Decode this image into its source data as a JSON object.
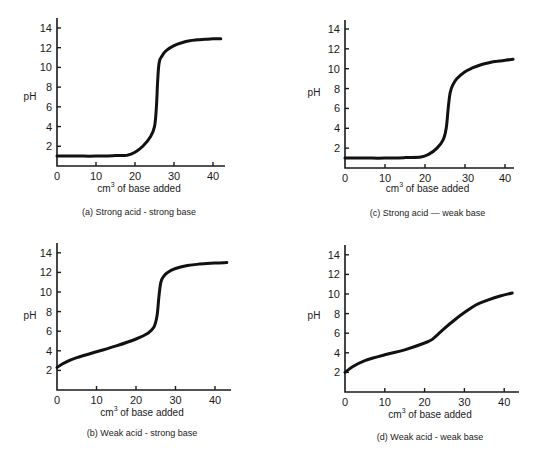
{
  "chart_data": [
    {
      "id": "a",
      "type": "line",
      "title": "(a) Strong acid - strong base",
      "xlabel": "cm3 of base added",
      "xlabel_main": "cm",
      "xlabel_sup": "3",
      "xlabel_rest": " of base added",
      "ylabel": "pH",
      "xlim": [
        0,
        42
      ],
      "ylim": [
        0,
        15
      ],
      "xticks": [
        0,
        10,
        20,
        30,
        40
      ],
      "yticks": [
        2,
        4,
        6,
        8,
        10,
        12,
        14
      ],
      "grid": false,
      "series": [
        {
          "name": "pH",
          "x": [
            0,
            5,
            10,
            15,
            18,
            20,
            22,
            24,
            25,
            25.5,
            25.8,
            26.2,
            27,
            28,
            30,
            32,
            34,
            36,
            38,
            40,
            42
          ],
          "y": [
            1.0,
            1.0,
            1.0,
            1.05,
            1.1,
            1.4,
            2.0,
            3.0,
            4.0,
            6.0,
            8.5,
            10.5,
            11.2,
            11.7,
            12.2,
            12.5,
            12.7,
            12.8,
            12.85,
            12.9,
            12.9
          ]
        }
      ],
      "layout": {
        "ox": 57,
        "oy": 166,
        "sx": 3.9,
        "sy": 9.86,
        "ytop": 18,
        "xend": 225,
        "ylabel_x": 30,
        "ylabel_y": 100,
        "xlabel_y": 192,
        "title_y": 215
      }
    },
    {
      "id": "c",
      "type": "line",
      "title": "(c) Strong acid — weak base",
      "xlabel": "cm3 of base added",
      "xlabel_main": "cm",
      "xlabel_sup": "3",
      "xlabel_rest": " of base added",
      "ylabel": "pH",
      "xlim": [
        0,
        42
      ],
      "ylim": [
        0,
        15
      ],
      "xticks": [
        0,
        10,
        20,
        30,
        40
      ],
      "xtick_labels": [
        "0",
        "10",
        "20",
        ". 30",
        "40"
      ],
      "yticks": [
        2,
        4,
        6,
        8,
        10,
        12,
        14
      ],
      "grid": false,
      "series": [
        {
          "name": "pH",
          "x": [
            0,
            5,
            10,
            15,
            19,
            21,
            23,
            24.5,
            25.3,
            25.8,
            26.3,
            27,
            28,
            30,
            32,
            34,
            36,
            38,
            40,
            42
          ],
          "y": [
            1.0,
            1.0,
            1.0,
            1.05,
            1.1,
            1.4,
            2.0,
            2.8,
            4.0,
            6.0,
            7.6,
            8.4,
            9.0,
            9.7,
            10.1,
            10.4,
            10.6,
            10.75,
            10.85,
            10.95
          ]
        }
      ],
      "layout": {
        "ox": 345,
        "oy": 168,
        "sx": 4.0,
        "sy": 9.93,
        "ytop": 20,
        "xend": 514,
        "ylabel_x": 314,
        "ylabel_y": 96,
        "xlabel_y": 192,
        "title_y": 216
      }
    },
    {
      "id": "b",
      "type": "line",
      "title": "(b) Weak acid - strong base",
      "xlabel": "cm3 of base added",
      "xlabel_main": "cm",
      "xlabel_sup": "3",
      "xlabel_rest": " of base added",
      "ylabel": "pH",
      "xlim": [
        0,
        44
      ],
      "ylim": [
        0,
        15
      ],
      "xticks": [
        0,
        10,
        20,
        30,
        40
      ],
      "yticks": [
        2,
        4,
        6,
        8,
        10,
        12,
        14
      ],
      "grid": false,
      "series": [
        {
          "name": "pH",
          "x": [
            0,
            2,
            5,
            10,
            15,
            20,
            23,
            24.5,
            25.3,
            25.8,
            26.3,
            27,
            28,
            30,
            33,
            36,
            40,
            43
          ],
          "y": [
            2.3,
            2.8,
            3.3,
            3.9,
            4.5,
            5.2,
            5.8,
            6.4,
            7.5,
            9.5,
            11.0,
            11.6,
            12.0,
            12.4,
            12.7,
            12.85,
            12.95,
            13.0
          ]
        }
      ],
      "layout": {
        "ox": 57,
        "oy": 390,
        "sx": 3.95,
        "sy": 9.8,
        "ytop": 243,
        "xend": 231,
        "ylabel_x": 30,
        "ylabel_y": 319,
        "xlabel_y": 416,
        "title_y": 436
      }
    },
    {
      "id": "d",
      "type": "line",
      "title": "(d) Weak acid - weak base",
      "xlabel": "cm3 of base added",
      "xlabel_main": "cm",
      "xlabel_sup": "3",
      "xlabel_rest": " of base added",
      "ylabel": "pH",
      "xlim": [
        0,
        44
      ],
      "ylim": [
        0,
        15
      ],
      "xticks": [
        0,
        10,
        20,
        30,
        40
      ],
      "yticks": [
        2,
        4,
        6,
        8,
        10,
        12,
        14
      ],
      "grid": false,
      "series": [
        {
          "name": "pH",
          "x": [
            0,
            2,
            5,
            10,
            15,
            20,
            22,
            25,
            28,
            30,
            33,
            36,
            39,
            42
          ],
          "y": [
            2.0,
            2.6,
            3.2,
            3.8,
            4.3,
            5.0,
            5.4,
            6.5,
            7.5,
            8.1,
            8.9,
            9.4,
            9.8,
            10.1
          ]
        }
      ],
      "layout": {
        "ox": 345,
        "oy": 392,
        "sx": 3.98,
        "sy": 9.8,
        "ytop": 245,
        "xend": 519,
        "ylabel_x": 314,
        "ylabel_y": 319,
        "xlabel_y": 418,
        "title_y": 440
      }
    }
  ]
}
